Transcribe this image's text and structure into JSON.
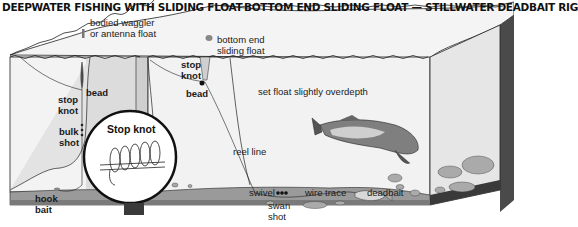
{
  "titles": {
    "left": "DEEPWATER FISHING WITH SLIDING FLOAT",
    "right": "BOTTOM END SLIDING FLOAT — STILLWATER DEADBAIT RIG"
  },
  "labels": {
    "bodied_waggler_1": "bodied waggler",
    "bodied_waggler_2": "or antenna float",
    "bottom_end_1": "bottom end",
    "bottom_end_2": "sliding float",
    "stop_knot_left_1": "stop",
    "stop_knot_left_2": "knot",
    "bead_left": "bead",
    "bulk_shot_1": "bulk",
    "bulk_shot_2": "shot",
    "hook_bait_1": "hook",
    "hook_bait_2": "bait",
    "stop_knot_right_1": "stop",
    "stop_knot_right_2": "knot",
    "bead_right": "bead",
    "overdepth": "set float slightly overdepth",
    "reel_line": "reel line",
    "swivel": "swivel",
    "wire_trace": "wire trace",
    "deadbait": "deadbait",
    "swan_shot_1": "swan",
    "swan_shot_2": "shot",
    "inset_title": "Stop knot"
  },
  "colors": {
    "water": "#efefef",
    "water_shade": "#d9d9d9",
    "bed": "#8a8a8a",
    "bed_dark": "#3a3a3a",
    "line": "#1a1a1a",
    "stone": "#a8a8a8"
  }
}
